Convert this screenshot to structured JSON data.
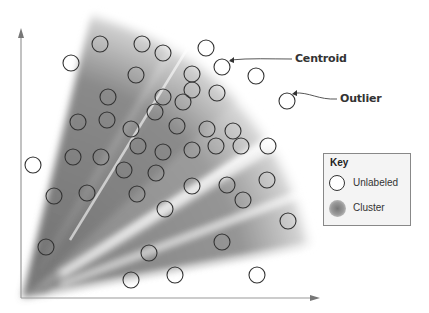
{
  "diagram": {
    "type": "cluster-scatter",
    "axes": {
      "x": "unlabeled",
      "y": "unlabeled"
    },
    "annotations": [
      {
        "text": "Centroid",
        "x": 295,
        "y": 59
      },
      {
        "text": "Outlier",
        "x": 340,
        "y": 99
      }
    ],
    "key": {
      "title": "Key",
      "items": [
        {
          "label": "Unlabeled",
          "symbol": "open-circle"
        },
        {
          "label": "Cluster",
          "symbol": "gray-blob"
        }
      ]
    },
    "colors": {
      "axis": "#999999",
      "circle_stroke": "#333333",
      "cluster_dark": "#6e6e6e",
      "background": "#ffffff"
    }
  },
  "chart_data": {
    "type": "scatter",
    "title": "",
    "xlabel": "",
    "ylabel": "",
    "clusters": 5,
    "points": [
      [
        71,
        63
      ],
      [
        100,
        44
      ],
      [
        142,
        44
      ],
      [
        163,
        53
      ],
      [
        206,
        48
      ],
      [
        222,
        67
      ],
      [
        256,
        76
      ],
      [
        287,
        101
      ],
      [
        136,
        75
      ],
      [
        192,
        74
      ],
      [
        108,
        97
      ],
      [
        163,
        97
      ],
      [
        192,
        90
      ],
      [
        217,
        93
      ],
      [
        78,
        122
      ],
      [
        107,
        120
      ],
      [
        155,
        112
      ],
      [
        183,
        102
      ],
      [
        131,
        129
      ],
      [
        177,
        126
      ],
      [
        207,
        129
      ],
      [
        233,
        131
      ],
      [
        73,
        157
      ],
      [
        101,
        157
      ],
      [
        138,
        146
      ],
      [
        163,
        152
      ],
      [
        192,
        150
      ],
      [
        216,
        146
      ],
      [
        241,
        146
      ],
      [
        268,
        146
      ],
      [
        33,
        165
      ],
      [
        124,
        170
      ],
      [
        156,
        173
      ],
      [
        192,
        186
      ],
      [
        227,
        185
      ],
      [
        267,
        180
      ],
      [
        54,
        196
      ],
      [
        87,
        193
      ],
      [
        137,
        194
      ],
      [
        243,
        200
      ],
      [
        165,
        209
      ],
      [
        288,
        221
      ],
      [
        222,
        242
      ],
      [
        46,
        247
      ],
      [
        149,
        253
      ],
      [
        131,
        280
      ],
      [
        175,
        275
      ],
      [
        257,
        275
      ]
    ]
  }
}
